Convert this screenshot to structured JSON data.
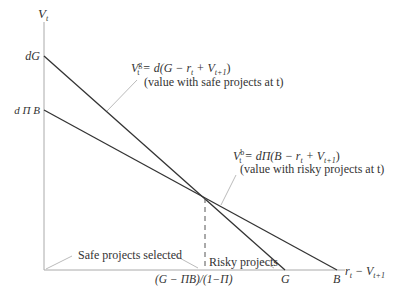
{
  "axes": {
    "y_label": "V",
    "y_label_sub": "t",
    "x_label": "r",
    "x_label_sub": "t",
    "x_label_rest": " − V",
    "x_label_rest_sub": "t+1"
  },
  "y_ticks": {
    "dG": "dG",
    "dPiB": "d Π B"
  },
  "x_ticks": {
    "threshold": "(G − ΠB)/(1−Π)",
    "G": "G",
    "B": "B"
  },
  "safe_line": {
    "formula_lhs": "V",
    "formula_sup": "g",
    "formula_sub": "t",
    "formula_rhs": " = d(G − r",
    "formula_rhs_sub": "t",
    "formula_rhs2": " + V",
    "formula_rhs2_sub": "t+1",
    "formula_close": ")",
    "caption": "(value with safe projects at t)"
  },
  "risky_line": {
    "formula_lhs": "V",
    "formula_sup": "b",
    "formula_sub": "t",
    "formula_rhs": " = dΠ(B − r",
    "formula_rhs_sub": "t",
    "formula_rhs2": " + V",
    "formula_rhs2_sub": "t+1",
    "formula_close": ")",
    "caption": "(value with risky projects at t)"
  },
  "regions": {
    "safe": "Safe projects selected",
    "risky": "Risky projects"
  }
}
